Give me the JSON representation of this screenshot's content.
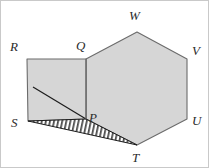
{
  "figure": {
    "kind": "geometry-diagram",
    "canvas": {
      "width": 209,
      "height": 168
    },
    "colors": {
      "shape_fill": "#d6d6d6",
      "shape_stroke": "#6b6b6b",
      "hatch_stroke": "#1c1c1c",
      "hatch_fill": "#ffffff",
      "label_color": "#2b2b2b",
      "background": "#ffffff",
      "frame": "#c9c9c9"
    },
    "points": {
      "P": {
        "x": 85,
        "y": 118
      },
      "Q": {
        "x": 85,
        "y": 58
      },
      "R": {
        "x": 26,
        "y": 58
      },
      "S": {
        "x": 27,
        "y": 120
      },
      "T": {
        "x": 136,
        "y": 144
      },
      "U": {
        "x": 186,
        "y": 118
      },
      "V": {
        "x": 186,
        "y": 58
      },
      "W": {
        "x": 136,
        "y": 31
      },
      "D": {
        "x": 32,
        "y": 86
      }
    },
    "hexagon_path": "85,118 85,58 136,31 186,58 186,118 136,144",
    "square_path": "26,58 85,58 85,118 27,120",
    "triangle_path": "27,120 85,118 136,144",
    "diagonal": {
      "x1": 32,
      "y1": 86,
      "x2": 85,
      "y2": 118
    },
    "labels": [
      {
        "id": "R",
        "text": "R",
        "x": 9,
        "y": 39
      },
      {
        "id": "Q",
        "text": "Q",
        "x": 75,
        "y": 38
      },
      {
        "id": "W",
        "text": "W",
        "x": 128,
        "y": 8
      },
      {
        "id": "V",
        "text": "V",
        "x": 191,
        "y": 43
      },
      {
        "id": "P",
        "text": "P",
        "x": 88,
        "y": 110
      },
      {
        "id": "U",
        "text": "U",
        "x": 191,
        "y": 113
      },
      {
        "id": "S",
        "text": "S",
        "x": 10,
        "y": 115
      },
      {
        "id": "T",
        "text": "T",
        "x": 131,
        "y": 150
      }
    ]
  }
}
